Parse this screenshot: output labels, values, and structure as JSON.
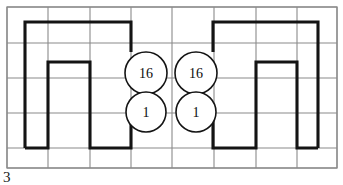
{
  "figure": {
    "caption_number": "3",
    "background_color": "#ffffff",
    "width": 343,
    "height": 185
  },
  "grid": {
    "line_color": "#8a8a8a",
    "x_positions": [
      7,
      48,
      90,
      131,
      172,
      214,
      256,
      297,
      337
    ],
    "y_positions": [
      7,
      43,
      78,
      113,
      148,
      168
    ],
    "columns": 8,
    "rows": 5
  },
  "paths": {
    "stroke_color": "#141414",
    "stroke_width": 3.1,
    "left_shape_points": "25,148 25,22 131,22 131,52",
    "left_inner_points": "131,113 131,148 90,148 90,62 48,62 48,148 25,148",
    "right_shape_points": "318,148 318,22 213,22 213,52",
    "right_inner_points": "213,113 213,148 256,148 256,62 297,62 297,148 318,148"
  },
  "nodes": [
    {
      "id": "node-top-left",
      "label": "16",
      "cx": 146,
      "cy": 73,
      "r": 21
    },
    {
      "id": "node-top-right",
      "label": "16",
      "cx": 196,
      "cy": 73,
      "r": 21
    },
    {
      "id": "node-bottom-left",
      "label": "1",
      "cx": 146,
      "cy": 112,
      "r": 20
    },
    {
      "id": "node-bottom-right",
      "label": "1",
      "cx": 196,
      "cy": 112,
      "r": 20
    }
  ]
}
